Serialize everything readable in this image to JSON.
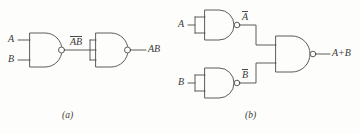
{
  "figure": {
    "background_color": "#fdfdfb",
    "line_color": "#4a4a4a",
    "text_color": "#3a3a3a",
    "width": 360,
    "height": 134
  },
  "panels": [
    {
      "caption": "(a)",
      "description": "AND function built from two NAND gates",
      "inputs": [
        {
          "label": "A"
        },
        {
          "label": "B"
        }
      ],
      "intermediate": {
        "label": "AB",
        "overbar": true
      },
      "output": {
        "label": "AB",
        "overbar": false
      },
      "gates": [
        {
          "type": "NAND",
          "inputs": 2,
          "output": "AB-bar"
        },
        {
          "type": "NAND",
          "inputs": 2,
          "note": "inputs tied together, acts as inverter",
          "output": "AB"
        }
      ]
    },
    {
      "caption": "(b)",
      "description": "OR function built from three NAND gates",
      "inputs": [
        {
          "label": "A"
        },
        {
          "label": "B"
        }
      ],
      "intermediates": [
        {
          "label": "A",
          "overbar": true
        },
        {
          "label": "B",
          "overbar": true
        }
      ],
      "output": {
        "label": "A+B",
        "overbar": false
      },
      "gates": [
        {
          "type": "NAND",
          "inputs": 2,
          "note": "inputs tied together, acts as inverter",
          "output": "A-bar"
        },
        {
          "type": "NAND",
          "inputs": 2,
          "note": "inputs tied together, acts as inverter",
          "output": "B-bar"
        },
        {
          "type": "NAND",
          "inputs": 2,
          "output": "A+B"
        }
      ]
    }
  ]
}
